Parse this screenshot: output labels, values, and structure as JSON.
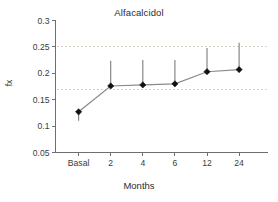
{
  "chart_data": {
    "type": "line",
    "title": "Alfacalcidol",
    "xlabel": "Months",
    "ylabel": "fx",
    "categories": [
      "Basal",
      "2",
      "4",
      "6",
      "12",
      "24"
    ],
    "values": [
      0.127,
      0.176,
      0.178,
      0.18,
      0.203,
      0.207
    ],
    "error_upper": [
      0.127,
      0.224,
      0.225,
      0.225,
      0.248,
      0.258
    ],
    "error_lower": [
      0.11,
      0.176,
      0.178,
      0.18,
      0.203,
      0.207
    ],
    "ylim": [
      0.05,
      0.3
    ],
    "yticks": [
      "0.05",
      "0.1",
      "0.15",
      "0.2",
      "0.25",
      "0.3"
    ],
    "ytick_values": [
      0.05,
      0.1,
      0.15,
      0.2,
      0.25,
      0.3
    ],
    "gridlines": [
      0.17,
      0.25
    ],
    "grid": true,
    "legend": "none",
    "marker": "filled-diamond",
    "line_color": "#8a8a8a",
    "marker_color": "#111111",
    "grid_color": "#d9d2c4",
    "axis_color": "#6e6e6e",
    "background": "#ffffff"
  }
}
